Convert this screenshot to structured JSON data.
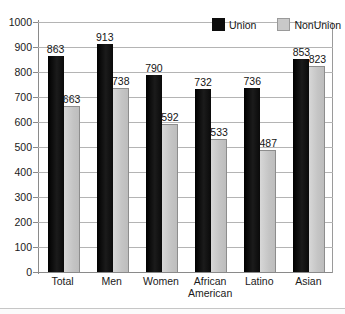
{
  "chart_data": {
    "type": "bar",
    "title": "",
    "subtitle": "",
    "xlabel": "",
    "ylabel": "",
    "ylim": [
      0,
      1000
    ],
    "ytick_step": 100,
    "yticks": [
      0,
      100,
      200,
      300,
      400,
      500,
      600,
      700,
      800,
      900,
      1000
    ],
    "ytick_labels": [
      "0",
      "100",
      "200",
      "300",
      "400",
      "500",
      "600",
      "700",
      "800",
      "900",
      "1000"
    ],
    "grid": true,
    "grid_axis": "y",
    "legend_position": "top-right",
    "categories": [
      "Total",
      "Men",
      "Women",
      "African\nAmerican",
      "Latino",
      "Asian"
    ],
    "series": [
      {
        "name": "Union",
        "color": "#0d0d0d",
        "values": [
          863,
          913,
          790,
          732,
          736,
          853
        ],
        "value_labels": [
          "863",
          "913",
          "790",
          "732",
          "736",
          "853"
        ]
      },
      {
        "name": "NonUnion",
        "color": "#c9c9c9",
        "values": [
          663,
          738,
          592,
          533,
          487,
          823
        ],
        "value_labels": [
          "663",
          "738",
          "592",
          "533",
          "487",
          "823"
        ]
      }
    ]
  },
  "legend": {
    "items": [
      {
        "label": "Union",
        "swatch": "union-swatch"
      },
      {
        "label": "NonUnion",
        "swatch": "nonunion-swatch"
      }
    ]
  }
}
